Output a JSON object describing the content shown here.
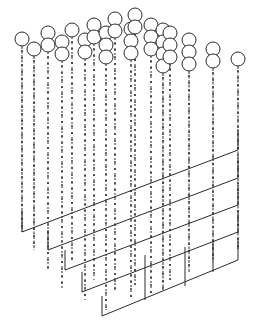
{
  "figure": {
    "colors": {
      "ink": "#2a2a2a",
      "paper": "#ffffff"
    },
    "planes": [
      {
        "corner": [
          22,
          232
        ],
        "right": [
          238,
          150
        ]
      },
      {
        "corner": [
          48,
          250
        ],
        "right": [
          238,
          178
        ]
      },
      {
        "corner": [
          65,
          270
        ],
        "right": [
          238,
          205
        ]
      },
      {
        "corner": [
          82,
          292
        ],
        "right": [
          238,
          232
        ]
      },
      {
        "corner": [
          102,
          316
        ],
        "right": [
          238,
          260
        ]
      }
    ],
    "circle_radius": 7
  }
}
